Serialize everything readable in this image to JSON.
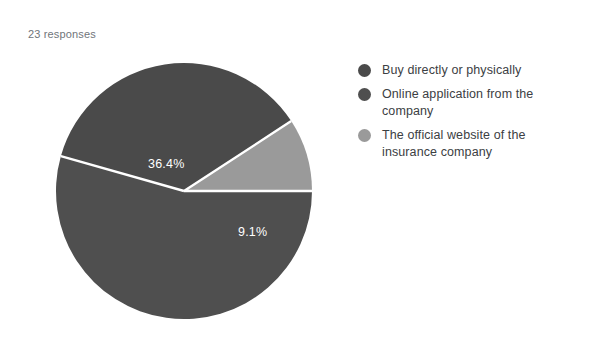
{
  "header": {
    "responses_text": "23 responses"
  },
  "colors": {
    "slice_dark": "#4a4a4a",
    "slice_dark_alt": "#4f4f4f",
    "slice_light": "#9a9a9a",
    "separator": "#ffffff",
    "label_text": "#ffffff",
    "legend_text": "#3c4043",
    "responses_text": "#70757a",
    "background": "#ffffff"
  },
  "chart_data": {
    "type": "pie",
    "title": "",
    "subtitle": "23 responses",
    "total_responses": 23,
    "legend_position": "right",
    "grid": false,
    "categories": [
      "Buy directly or physically",
      "Online application from the company",
      "The official website of the insurance company"
    ],
    "values": [
      36.4,
      54.5,
      9.1
    ],
    "value_unit": "percent",
    "counts": [
      8,
      13,
      2
    ],
    "data_labels": [
      "36.4%",
      "54.5%",
      "9.1%"
    ],
    "slice_colors": [
      "#4a4a4a",
      "#4f4f4f",
      "#9a9a9a"
    ],
    "slices": [
      {
        "label": "Buy directly or physically",
        "data_label": "36.4%",
        "value": 36.4,
        "color": "#4a4a4a",
        "start_angle": 33.1,
        "end_angle": 164.2
      },
      {
        "label": "Online application from the company",
        "data_label": "54.5%",
        "value": 54.5,
        "color": "#4f4f4f",
        "start_angle": 164.2,
        "end_angle": 360.0
      },
      {
        "label": "The official website of the insurance company",
        "data_label": "9.1%",
        "value": 9.1,
        "color": "#9a9a9a",
        "start_angle": 0.0,
        "end_angle": 33.1
      }
    ]
  },
  "legend": {
    "items": [
      {
        "label": "Buy directly or physically",
        "color": "#4a4a4a"
      },
      {
        "label": "Online application from the company",
        "color": "#4f4f4f"
      },
      {
        "label": "The official website of the insurance company",
        "color": "#9a9a9a"
      }
    ]
  }
}
